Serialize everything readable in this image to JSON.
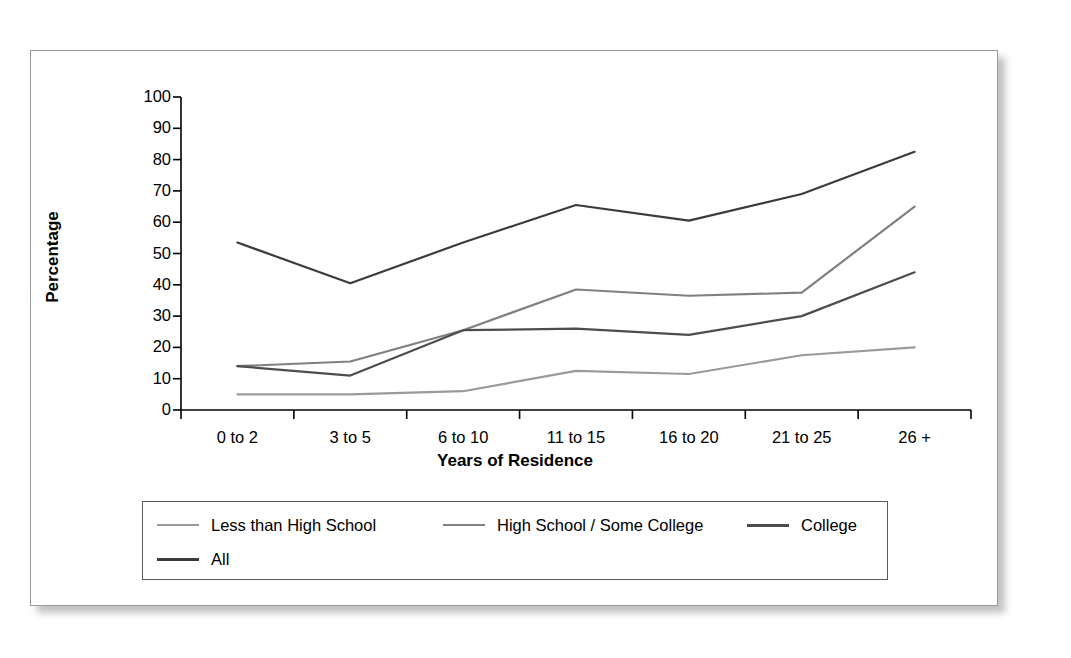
{
  "figure": {
    "background_color": "#ffffff",
    "panel_border_color": "#9a9a9a"
  },
  "chart_data": {
    "type": "line",
    "title": "",
    "xlabel": "Years of Residence",
    "ylabel": "Percentage",
    "categories": [
      "0 to 2",
      "3 to 5",
      "6 to 10",
      "11 to 15",
      "16 to 20",
      "21 to 25",
      "26 +"
    ],
    "ylim": [
      0,
      100
    ],
    "yticks": [
      0,
      10,
      20,
      30,
      40,
      50,
      60,
      70,
      80,
      90,
      100
    ],
    "grid": false,
    "legend_position": "bottom",
    "series": [
      {
        "name": "Less than High School",
        "color": "#9a9a9a",
        "values": [
          5,
          5,
          6,
          12.5,
          11.5,
          17.5,
          20
        ]
      },
      {
        "name": "High School / Some College",
        "color": "#808080",
        "values": [
          14,
          15.5,
          25.5,
          38.5,
          36.5,
          37.5,
          65
        ]
      },
      {
        "name": "College",
        "color": "#4d4d4d",
        "values": [
          14,
          11,
          25.5,
          26,
          24,
          30,
          44
        ]
      },
      {
        "name": "All",
        "color": "#3b3b3b",
        "values": [
          53.5,
          40.5,
          53.5,
          65.5,
          60.5,
          69,
          82.5
        ]
      }
    ]
  },
  "axis": {
    "y_tick_labels": [
      "100",
      "90",
      "80",
      "70",
      "60",
      "50",
      "40",
      "30",
      "20",
      "10",
      "0"
    ],
    "x_tick_labels": [
      "0 to 2",
      "3 to 5",
      "6 to 10",
      "11 to 15",
      "16 to 20",
      "21 to 25",
      "26 +"
    ],
    "y_title": "Percentage",
    "x_title": "Years of Residence"
  },
  "legend": {
    "entries": [
      {
        "label": "Less than High School",
        "color": "#9a9a9a"
      },
      {
        "label": "High School / Some College",
        "color": "#808080"
      },
      {
        "label": "College",
        "color": "#4d4d4d"
      },
      {
        "label": "All",
        "color": "#3b3b3b"
      }
    ]
  }
}
